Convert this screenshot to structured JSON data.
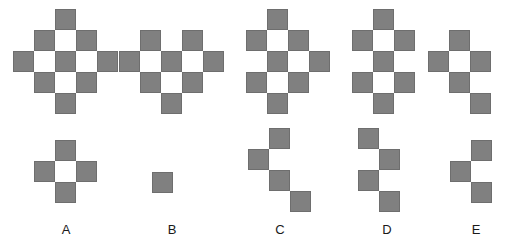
{
  "puzzle": {
    "type": "visual-sequence-reasoning",
    "cell_size": 21,
    "colors": {
      "filled": "#808080",
      "cell_border": "#6e6e6e",
      "background": "#ffffff",
      "label_text": "#1a1a1a"
    },
    "sequence": {
      "name": "top-row-sequence",
      "description": "Five progressively decaying 5x5 checkerboard diamond figures",
      "figures": [
        {
          "id": "seq-1",
          "index": 1,
          "x": 13,
          "y": 9,
          "cols": 5,
          "rows": 5,
          "cells": [
            [
              0,
              0,
              1,
              0,
              0
            ],
            [
              0,
              1,
              0,
              1,
              0
            ],
            [
              1,
              0,
              1,
              0,
              1
            ],
            [
              0,
              1,
              0,
              1,
              0
            ],
            [
              0,
              0,
              1,
              0,
              0
            ]
          ]
        },
        {
          "id": "seq-2",
          "index": 2,
          "x": 119,
          "y": 9,
          "cols": 5,
          "rows": 5,
          "cells": [
            [
              0,
              0,
              0,
              0,
              0
            ],
            [
              0,
              1,
              0,
              1,
              0
            ],
            [
              1,
              0,
              1,
              0,
              1
            ],
            [
              0,
              1,
              0,
              1,
              0
            ],
            [
              0,
              0,
              1,
              0,
              0
            ]
          ]
        },
        {
          "id": "seq-3",
          "index": 3,
          "x": 225,
          "y": 9,
          "cols": 5,
          "rows": 5,
          "cells": [
            [
              0,
              0,
              1,
              0,
              0
            ],
            [
              0,
              1,
              0,
              1,
              0
            ],
            [
              0,
              0,
              1,
              0,
              1
            ],
            [
              0,
              1,
              0,
              1,
              0
            ],
            [
              0,
              0,
              1,
              0,
              0
            ]
          ]
        },
        {
          "id": "seq-4",
          "index": 4,
          "x": 331,
          "y": 9,
          "cols": 5,
          "rows": 5,
          "cells": [
            [
              0,
              0,
              1,
              0,
              0
            ],
            [
              0,
              1,
              0,
              1,
              0
            ],
            [
              0,
              0,
              1,
              0,
              0
            ],
            [
              0,
              1,
              0,
              1,
              0
            ],
            [
              0,
              0,
              1,
              0,
              0
            ]
          ]
        },
        {
          "id": "seq-5",
          "index": 5,
          "x": 428,
          "y": 9,
          "cols": 4,
          "rows": 5,
          "cells": [
            [
              0,
              0,
              0,
              0
            ],
            [
              0,
              1,
              0,
              0
            ],
            [
              1,
              0,
              1,
              0
            ],
            [
              0,
              1,
              0,
              0
            ],
            [
              0,
              0,
              1,
              0
            ]
          ]
        }
      ]
    },
    "options": {
      "name": "answer-options-row",
      "items": [
        {
          "id": "option-a",
          "label": "A",
          "x": 34,
          "y": 140,
          "label_x": 54,
          "label_y": 222,
          "cols": 3,
          "rows": 3,
          "cells": [
            [
              0,
              1,
              0
            ],
            [
              1,
              0,
              1
            ],
            [
              0,
              1,
              0
            ]
          ]
        },
        {
          "id": "option-b",
          "label": "B",
          "x": 152,
          "y": 172,
          "label_x": 160,
          "label_y": 222,
          "cols": 1,
          "rows": 1,
          "cells": [
            [
              1
            ]
          ]
        },
        {
          "id": "option-c",
          "label": "C",
          "x": 248,
          "y": 128,
          "label_x": 268,
          "label_y": 222,
          "cols": 3,
          "rows": 4,
          "cells": [
            [
              0,
              1,
              0
            ],
            [
              1,
              0,
              0
            ],
            [
              0,
              1,
              0
            ],
            [
              0,
              0,
              1
            ]
          ]
        },
        {
          "id": "option-d",
          "label": "D",
          "x": 358,
          "y": 128,
          "label_x": 375,
          "label_y": 222,
          "cols": 2,
          "rows": 4,
          "cells": [
            [
              1,
              0
            ],
            [
              0,
              1
            ],
            [
              1,
              0
            ],
            [
              0,
              1
            ]
          ]
        },
        {
          "id": "option-e",
          "label": "E",
          "x": 450,
          "y": 140,
          "label_x": 464,
          "label_y": 222,
          "cols": 2,
          "rows": 3,
          "cells": [
            [
              0,
              1
            ],
            [
              1,
              0
            ],
            [
              0,
              1
            ]
          ]
        }
      ]
    }
  }
}
